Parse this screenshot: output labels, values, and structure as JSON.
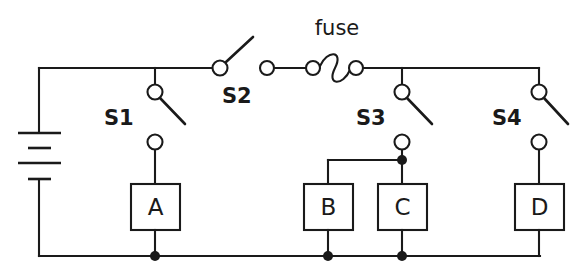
{
  "diagram": {
    "background_color": "#ffffff",
    "line_color": "#1a1a1a"
  },
  "labels": {
    "fuse": "fuse",
    "s1": "S1",
    "s2": "S2",
    "s3": "S3",
    "s4": "S4"
  },
  "components": {
    "box_a": "A",
    "box_b": "B",
    "box_c": "C",
    "box_d": "D"
  },
  "elements": {
    "battery_name": "battery",
    "fuse_name": "fuse",
    "switch_s1_name": "switch-s1",
    "switch_s2_name": "switch-s2",
    "switch_s3_name": "switch-s3",
    "switch_s4_name": "switch-s4"
  }
}
